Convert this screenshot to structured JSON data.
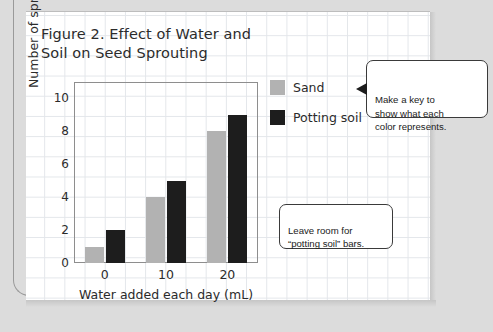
{
  "page": {
    "figure_title": "Figure 2. Effect of Water and\nSoil on Seed Sprouting"
  },
  "legend": {
    "items": [
      {
        "label": "Sand",
        "color": "#b2b2b2"
      },
      {
        "label": "Potting soil",
        "color": "#1d1d1d"
      }
    ]
  },
  "callouts": [
    {
      "name": "make-a-key",
      "text": "Make a key to\nshow what each\ncolor represents."
    },
    {
      "name": "leave-room",
      "text": "Leave room for\n“potting soil” bars."
    }
  ],
  "chart_data": {
    "type": "bar",
    "title": "Figure 2. Effect of Water and Soil on Seed Sprouting",
    "xlabel": "Water added each day (mL)",
    "ylabel": "Number of sprouting seeds",
    "categories": [
      "0",
      "10",
      "20"
    ],
    "series": [
      {
        "name": "Sand",
        "color": "#b2b2b2",
        "values": [
          1,
          4,
          8
        ]
      },
      {
        "name": "Potting soil",
        "color": "#1d1d1d",
        "values": [
          2,
          5,
          9
        ]
      }
    ],
    "ylim": [
      0,
      11
    ],
    "yticks": [
      0,
      2,
      4,
      6,
      8,
      10
    ],
    "ytick_labels": [
      "0",
      "2",
      "4",
      "6",
      "8",
      "10"
    ],
    "xtick_labels": [
      "0",
      "10",
      "20"
    ],
    "grid": false,
    "legend_position": "right"
  }
}
